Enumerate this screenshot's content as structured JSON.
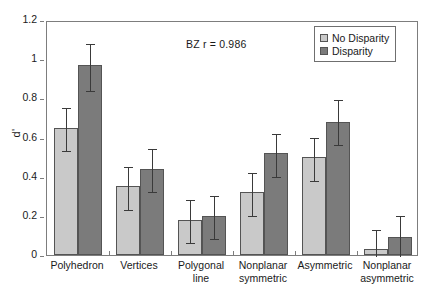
{
  "chart_data": {
    "type": "bar",
    "title": "",
    "subtitle": "",
    "xlabel": "",
    "ylabel": "d'",
    "ylim": [
      0,
      1.2
    ],
    "yticks": [
      "0",
      "0.2",
      "0.4",
      "0.6",
      "0.8",
      "1",
      "1.2"
    ],
    "ytick_values": [
      0,
      0.2,
      0.4,
      0.6,
      0.8,
      1.0,
      1.2
    ],
    "grid": false,
    "legend_position": "top-right",
    "categories": [
      "Polyhedron",
      "Vertices",
      "Polygonal line",
      "Nonplanar symmetric",
      "Asymmetric",
      "Nonplanar asymmetric"
    ],
    "category_lines": [
      [
        "Polyhedron"
      ],
      [
        "Vertices"
      ],
      [
        "Polygonal",
        "line"
      ],
      [
        "Nonplanar",
        "symmetric"
      ],
      [
        "Asymmetric"
      ],
      [
        "Nonplanar",
        "asymmetric"
      ]
    ],
    "series": [
      {
        "name": "No Disparity",
        "color": "#c9c9c9",
        "values": [
          0.65,
          0.35,
          0.18,
          0.32,
          0.5,
          0.03
        ],
        "errors_upper": [
          0.76,
          0.46,
          0.29,
          0.43,
          0.61,
          0.14
        ],
        "errors_lower": [
          0.54,
          0.24,
          0.07,
          0.21,
          0.39,
          0.0
        ]
      },
      {
        "name": "Disparity",
        "color": "#7b7b7b",
        "values": [
          0.97,
          0.44,
          0.2,
          0.52,
          0.68,
          0.09
        ],
        "errors_upper": [
          1.09,
          0.55,
          0.31,
          0.63,
          0.8,
          0.21
        ],
        "errors_lower": [
          0.85,
          0.33,
          0.09,
          0.41,
          0.57,
          0.0
        ]
      }
    ],
    "annotations": [
      {
        "text": "BZ  r = 0.986"
      }
    ]
  },
  "legend": {
    "items": [
      {
        "label": "No Disparity",
        "color": "#c9c9c9"
      },
      {
        "label": "Disparity",
        "color": "#7b7b7b"
      }
    ]
  }
}
